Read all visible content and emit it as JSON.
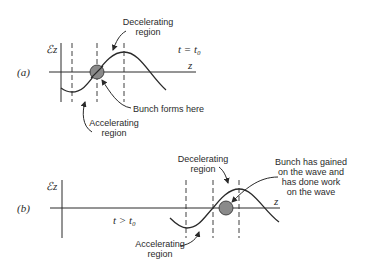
{
  "panels": [
    {
      "id": "a",
      "tag": "(a)",
      "y_axis_label": "ℰz",
      "x_axis_label": "z",
      "time_label": "t = t₀",
      "annotations": {
        "decelerating": [
          "Decelerating",
          "region"
        ],
        "accelerating": [
          "Accelerating",
          "region"
        ],
        "bunch": [
          "Bunch forms here"
        ]
      }
    },
    {
      "id": "b",
      "tag": "(b)",
      "y_axis_label": "ℰz",
      "x_axis_label": "z",
      "time_label": "t > t₀",
      "annotations": {
        "decelerating": [
          "Decelerating",
          "region"
        ],
        "accelerating": [
          "Accelerating",
          "region"
        ],
        "bunch": [
          "Bunch has gained",
          "on the wave and",
          "has done work",
          "on the wave"
        ]
      }
    }
  ],
  "colors": {
    "line": "#2a2a2a",
    "bunch_fill": "#8a8a8a"
  }
}
